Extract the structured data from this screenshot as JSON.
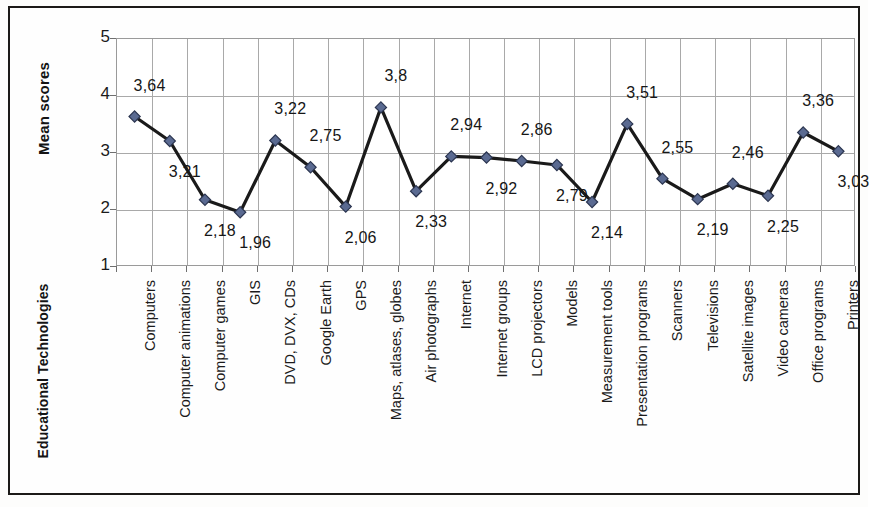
{
  "chart_data": {
    "type": "line",
    "title": "",
    "xlabel": "Educational Technologies",
    "ylabel": "Mean scores",
    "ylim": [
      1,
      5
    ],
    "yticks": [
      "1",
      "2",
      "3",
      "4",
      "5"
    ],
    "grid": true,
    "legend": false,
    "marker": "diamond",
    "marker_color": "#5a6a91",
    "line_color": "#1a1a1a",
    "categories": [
      "Computers",
      "Computer animations",
      "Computer games",
      "GIS",
      "DVD, DVX, CDs",
      "Google Earth",
      "GPS",
      "Maps, atlases, globes",
      "Air photographs",
      "Internet",
      "Internet groups",
      "LCD projectors",
      "Models",
      "Measurement tools",
      "Presentation programs",
      "Scanners",
      "Televisions",
      "Satellite images",
      "Video cameras",
      "Office programs",
      "Printers"
    ],
    "values": [
      3.64,
      3.21,
      2.18,
      1.96,
      3.22,
      2.75,
      2.06,
      3.8,
      2.33,
      2.94,
      2.92,
      2.86,
      2.79,
      2.14,
      3.51,
      2.55,
      2.19,
      2.46,
      2.25,
      3.36,
      3.03
    ],
    "value_labels": [
      "3,64",
      "3,21",
      "2,18",
      "1,96",
      "3,22",
      "2,75",
      "2,06",
      "3,8",
      "2,33",
      "2,94",
      "2,92",
      "2,86",
      "2,79",
      "2,14",
      "3,51",
      "2,55",
      "2,19",
      "2,46",
      "2,25",
      "3,36",
      "3,03"
    ],
    "label_positions": [
      "above",
      "below",
      "below",
      "below",
      "above",
      "above",
      "below",
      "above",
      "below",
      "above",
      "below",
      "above",
      "below",
      "below",
      "above",
      "above",
      "below",
      "above",
      "below",
      "above",
      "below"
    ]
  }
}
